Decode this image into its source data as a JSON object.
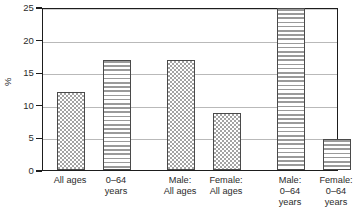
{
  "chart_data": {
    "type": "bar",
    "title": "",
    "xlabel": "",
    "ylabel": "%",
    "ylim": [
      0,
      25
    ],
    "yticks": [
      0,
      5,
      10,
      15,
      20,
      25
    ],
    "ytick_labels": [
      "0",
      "5",
      "10",
      "15",
      "20",
      "25"
    ],
    "grid": true,
    "legend": "none",
    "categories": [
      "All ages",
      "0–64\nyears",
      "Male:\nAll ages",
      "Female:\nAll ages",
      "Male:\n0–64\nyears",
      "Female:\n0–64\nyears"
    ],
    "values": [
      11.9,
      16.8,
      16.8,
      8.8,
      24.8,
      4.7
    ],
    "patterns": [
      "dotted",
      "striped",
      "dotted",
      "dotted",
      "striped",
      "striped"
    ],
    "colors": {
      "dotted_fill": "#a3a3a3",
      "striped_fill": "#9a9a9a",
      "bar_outline": "#4a4a4a",
      "axis": "#1d1d1d",
      "gridline": "#b9b9b9",
      "background": "#ffffff",
      "text": "#2b2b2b"
    }
  }
}
